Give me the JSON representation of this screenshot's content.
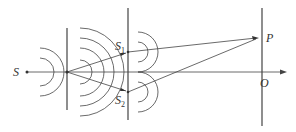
{
  "diagram": {
    "labels": {
      "source": "S",
      "slit1_main": "S",
      "slit1_sub": "1",
      "slit2_main": "S",
      "slit2_sub": "2",
      "point_p": "P",
      "origin": "O"
    },
    "colors": {
      "line": "#444444",
      "text": "#333333",
      "background": "#ffffff"
    }
  }
}
